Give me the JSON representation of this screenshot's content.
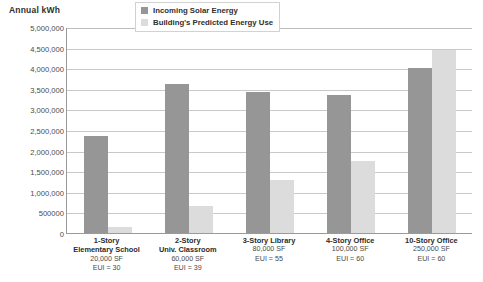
{
  "chart_data": {
    "type": "bar",
    "title": "Annual kWh",
    "xlabel": "",
    "ylabel": "Annual kWh",
    "ylim": [
      0,
      5000000
    ],
    "grid": true,
    "legend_position": "top-center",
    "categories": [
      "1-Story Elementary School",
      "2-Story Univ. Classroom",
      "3-Story Library",
      "4-Story Office",
      "10-Story Office"
    ],
    "series": [
      {
        "name": "Incoming Solar Energy",
        "color": "#969696",
        "values": [
          2350000,
          3620000,
          3420000,
          3350000,
          4000000
        ]
      },
      {
        "name": "Building's Predicted Energy Use",
        "color": "#dcdcdc",
        "values": [
          150000,
          650000,
          1280000,
          1750000,
          4450000
        ]
      }
    ],
    "y_ticks": [
      {
        "value": 5000000,
        "label": "5,000,000"
      },
      {
        "value": 4500000,
        "label": "4,500,000"
      },
      {
        "value": 4000000,
        "label": "4,000,000"
      },
      {
        "value": 3500000,
        "label": "3,500,000"
      },
      {
        "value": 3000000,
        "label": "3,000,000"
      },
      {
        "value": 2500000,
        "label": "2,500,000"
      },
      {
        "value": 2000000,
        "label": "2,000,000"
      },
      {
        "value": 1500000,
        "label": "1,500,000"
      },
      {
        "value": 1000000,
        "label": "1,000,000"
      },
      {
        "value": 500000,
        "label": "500000"
      },
      {
        "value": 0,
        "label": "0"
      }
    ],
    "category_details": [
      {
        "name": "1-Story",
        "name2": "Elementary School",
        "area": "20,000 SF",
        "eui": "EUI = 30"
      },
      {
        "name": "2-Story",
        "name2": "Univ. Classroom",
        "area": "60,000 SF",
        "eui": "EUI = 39"
      },
      {
        "name": "3-Story Library",
        "name2": "",
        "area": "80,000 SF",
        "eui": "EUI = 55"
      },
      {
        "name": "4-Story Office",
        "name2": "",
        "area": "100,000 SF",
        "eui": "EUI = 60"
      },
      {
        "name": "10-Story Office",
        "name2": "",
        "area": "250,000 SF",
        "eui": "EUI = 60"
      }
    ]
  },
  "legend": {
    "items": [
      {
        "label": "Incoming Solar Energy"
      },
      {
        "label": "Building's Predicted Energy Use"
      }
    ]
  },
  "colors": {
    "solar": "#969696",
    "use": "#dcdcdc",
    "grid": "#c9c9c9",
    "axis": "#9a9a9a",
    "text": "#3b3b3b"
  }
}
